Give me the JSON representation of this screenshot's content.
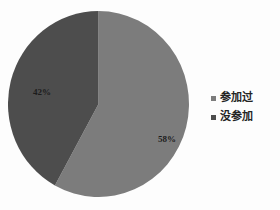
{
  "chart_data": {
    "type": "pie",
    "title": "",
    "xlabel": "",
    "ylabel": "",
    "categories": [
      "参加过",
      "没参加"
    ],
    "values": [
      58,
      42
    ],
    "unit": "%",
    "data_labels": [
      "58%",
      "42%"
    ],
    "legend_position": "right",
    "grid": false,
    "start_angle_deg": 0,
    "direction": "clockwise",
    "slices": [
      {
        "name": "参加过",
        "value": 58,
        "label": "58%",
        "color": "#7c7c7c",
        "start_angle_deg": 0,
        "end_angle_deg": 208.8
      },
      {
        "name": "没参加",
        "value": 42,
        "label": "42%",
        "color": "#4d4d4d",
        "start_angle_deg": 208.8,
        "end_angle_deg": 360
      }
    ]
  },
  "legend": {
    "items": [
      {
        "label": "参加过",
        "color": "#7c7c7c",
        "marker": "square-marker"
      },
      {
        "label": "没参加",
        "color": "#4d4d4d",
        "marker": "square-marker"
      }
    ]
  },
  "labels": {
    "participated_pct": "58%",
    "not_participated_pct": "42%"
  },
  "colors": {
    "background": "#fdfdfd",
    "slice_participated": "#7c7c7c",
    "slice_not_participated": "#4d4d4d",
    "label_text": "#1c1c1c",
    "legend_text": "#242424"
  }
}
